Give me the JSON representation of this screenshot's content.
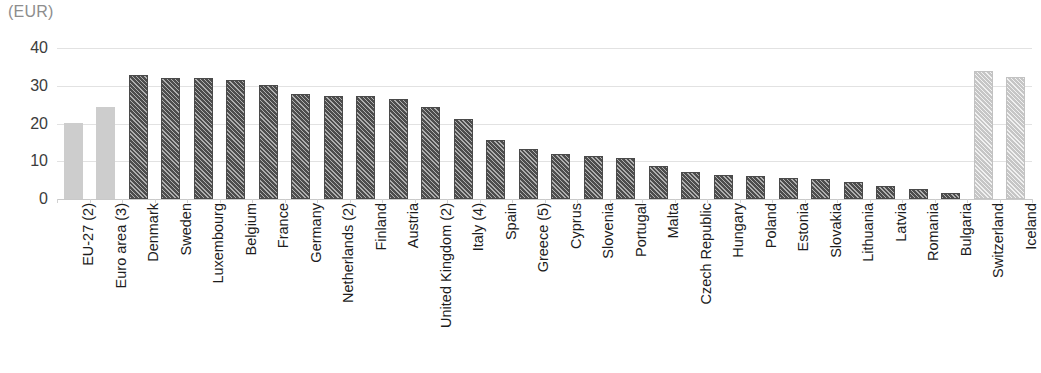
{
  "chart_data": {
    "type": "bar",
    "title": "",
    "subtitle": "",
    "unit_label": "(EUR)",
    "xlabel": "",
    "ylabel": "",
    "ylim": [
      0,
      40
    ],
    "yticks": [
      0,
      10,
      20,
      30,
      40
    ],
    "ytick_labels": [
      "0",
      "10",
      "20",
      "30",
      "40"
    ],
    "grid": true,
    "legend": "none",
    "categories": [
      "EU-27 (2)",
      "Euro area (3)",
      "Denmark",
      "Sweden",
      "Luxembourg",
      "Belgium",
      "France",
      "Germany",
      "Netherlands (2)",
      "Finland",
      "Austria",
      "United Kingdom (2)",
      "Italy (4)",
      "Spain",
      "Greece (5)",
      "Cyprus",
      "Slovenia",
      "Portugal",
      "Malta",
      "Czech Republic",
      "Hungary",
      "Poland",
      "Estonia",
      "Slovakia",
      "Lithuania",
      "Latvia",
      "Romania",
      "Bulgaria",
      "Switzerland",
      "Iceland"
    ],
    "values": [
      20.1,
      24.5,
      32.9,
      32.1,
      32.0,
      31.6,
      30.3,
      27.8,
      27.4,
      27.2,
      26.5,
      24.4,
      21.3,
      15.7,
      13.2,
      11.9,
      11.3,
      10.8,
      8.7,
      7.1,
      6.3,
      6.0,
      5.5,
      5.2,
      4.4,
      3.4,
      2.6,
      1.7,
      33.8,
      32.4
    ],
    "series_styles": [
      "solid-light",
      "solid-light",
      "hatch-dark",
      "hatch-dark",
      "hatch-dark",
      "hatch-dark",
      "hatch-dark",
      "hatch-dark",
      "hatch-dark",
      "hatch-dark",
      "hatch-dark",
      "hatch-dark",
      "hatch-dark",
      "hatch-dark",
      "hatch-dark",
      "hatch-dark",
      "hatch-dark",
      "hatch-dark",
      "hatch-dark",
      "hatch-dark",
      "hatch-dark",
      "hatch-dark",
      "hatch-dark",
      "hatch-dark",
      "hatch-dark",
      "hatch-dark",
      "hatch-dark",
      "hatch-dark",
      "hatch-light",
      "hatch-light"
    ],
    "colors": {
      "aggregate_bar": "#cdcdcd",
      "member_state_bar": "#4d4d4d",
      "efta_bar": "#c6c6c6",
      "gridline": "#e2e2e2",
      "axis_text": "#3c3c3c",
      "category_text": "#1c1c1c",
      "unit_text": "#8d8d8d"
    }
  }
}
